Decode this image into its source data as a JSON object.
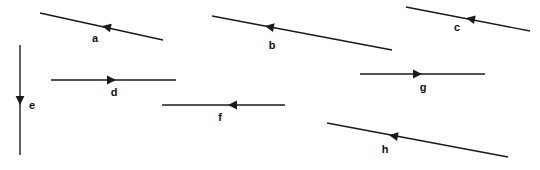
{
  "figure": {
    "width": 540,
    "height": 170,
    "background_color": "#ffffff",
    "stroke_color": "#1a1a1a",
    "label_color": "#111111",
    "line_width": 1.4
  },
  "chart_data": {
    "type": "diagram",
    "title": "",
    "xlabel": "",
    "ylabel": "",
    "grid": false,
    "legend": false,
    "vectors": [
      {
        "label": "a",
        "x1": 40,
        "y1": 13,
        "x2": 163,
        "y2": 40,
        "arrow_x": 102,
        "arrow_y": 26,
        "direction": "left-up",
        "angle_deg": 192,
        "label_x": 95,
        "label_y": 38
      },
      {
        "label": "b",
        "x1": 212,
        "y1": 16,
        "x2": 392,
        "y2": 50,
        "arrow_x": 265,
        "arrow_y": 26,
        "direction": "left-up",
        "angle_deg": 191,
        "label_x": 272,
        "label_y": 45
      },
      {
        "label": "c",
        "x1": 406,
        "y1": 7,
        "x2": 530,
        "y2": 31,
        "arrow_x": 466,
        "arrow_y": 18,
        "direction": "left-up",
        "angle_deg": 191,
        "label_x": 457,
        "label_y": 27
      },
      {
        "label": "d",
        "x1": 51,
        "y1": 80,
        "x2": 176,
        "y2": 80,
        "arrow_x": 116,
        "arrow_y": 80,
        "direction": "right",
        "angle_deg": 0,
        "label_x": 114,
        "label_y": 92
      },
      {
        "label": "e",
        "x1": 20,
        "y1": 45,
        "x2": 20,
        "y2": 155,
        "arrow_x": 20,
        "arrow_y": 105,
        "direction": "down",
        "angle_deg": 270,
        "label_x": 32,
        "label_y": 105
      },
      {
        "label": "f",
        "x1": 162,
        "y1": 105,
        "x2": 285,
        "y2": 105,
        "arrow_x": 228,
        "arrow_y": 105,
        "direction": "left",
        "angle_deg": 180,
        "label_x": 220,
        "label_y": 117
      },
      {
        "label": "g",
        "x1": 360,
        "y1": 74,
        "x2": 485,
        "y2": 74,
        "arrow_x": 422,
        "arrow_y": 74,
        "direction": "right",
        "angle_deg": 0,
        "label_x": 423,
        "label_y": 87
      },
      {
        "label": "h",
        "x1": 327,
        "y1": 123,
        "x2": 508,
        "y2": 157,
        "arrow_x": 389,
        "arrow_y": 135,
        "direction": "left-up",
        "angle_deg": 191,
        "label_x": 385,
        "label_y": 149
      }
    ]
  }
}
